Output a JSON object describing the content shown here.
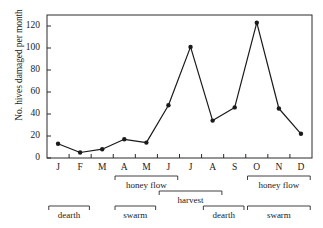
{
  "chart_data": {
    "type": "line",
    "title": "",
    "xlabel": "",
    "ylabel": "No. hives damaged per month",
    "categories": [
      "J",
      "F",
      "M",
      "A",
      "M",
      "J",
      "J",
      "A",
      "S",
      "O",
      "N",
      "D"
    ],
    "values": [
      13,
      5,
      8,
      17,
      14,
      48,
      101,
      34,
      46,
      123,
      45,
      22
    ],
    "series": [
      {
        "name": "Hives damaged",
        "values": [
          13,
          5,
          8,
          17,
          14,
          48,
          101,
          34,
          46,
          123,
          45,
          22
        ]
      }
    ],
    "ylim": [
      0,
      130
    ],
    "yticks": [
      0,
      20,
      40,
      60,
      80,
      100,
      120
    ],
    "ytick_labels": [
      "0",
      "20",
      "40",
      "60",
      "80",
      "100",
      "120"
    ],
    "grid": false,
    "legend": "none",
    "marker": "filled-circle",
    "line_color": "#1a1a1a",
    "annotations": [
      {
        "label": "honey flow",
        "start_month": "A",
        "end_month": "J",
        "row": 1
      },
      {
        "label": "harvest",
        "start_month": "J",
        "end_month": "A",
        "row": 2
      },
      {
        "label": "honey flow",
        "start_month": "O",
        "end_month": "D",
        "row": 1
      },
      {
        "label": "dearth",
        "start_month": "J",
        "end_month": "F",
        "row": 3
      },
      {
        "label": "swarm",
        "start_month": "A",
        "end_month": "M",
        "row": 3
      },
      {
        "label": "dearth",
        "start_month": "A",
        "end_month": "S",
        "row": 3
      },
      {
        "label": "swarm",
        "start_month": "O",
        "end_month": "D",
        "row": 3
      }
    ]
  }
}
